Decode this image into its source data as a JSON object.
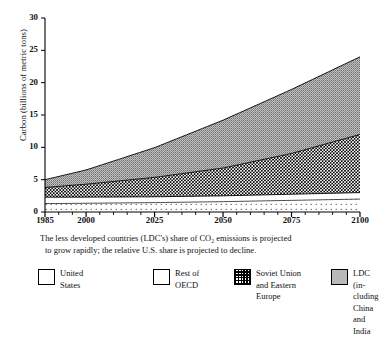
{
  "chart_data": {
    "type": "area",
    "stacked": true,
    "title": "",
    "xlabel": "",
    "ylabel": "Carbon (billions of metric tons)",
    "xlim": [
      1985,
      2100
    ],
    "ylim": [
      0,
      30
    ],
    "yticks": [
      0,
      5,
      10,
      15,
      20,
      25,
      30
    ],
    "xticks": [
      1985,
      2000,
      2025,
      2050,
      2075,
      2100
    ],
    "grid": false,
    "legend_position": "below",
    "x": [
      1985,
      2000,
      2025,
      2050,
      2075,
      2100
    ],
    "series": [
      {
        "name": "United States",
        "pattern": "sparse-dots",
        "values": [
          1.3,
          1.35,
          1.45,
          1.6,
          1.8,
          2.0
        ]
      },
      {
        "name": "Rest of OECD",
        "pattern": "white",
        "values": [
          1.0,
          0.95,
          0.9,
          0.9,
          0.95,
          1.0
        ]
      },
      {
        "name": "Soviet Union and Eastern Europe",
        "pattern": "checkerboard",
        "values": [
          1.5,
          2.0,
          3.0,
          4.3,
          6.3,
          9.0
        ]
      },
      {
        "name": "LDC (including China and India)",
        "pattern": "gray-stipple",
        "values": [
          1.2,
          2.2,
          4.6,
          7.4,
          9.9,
          12.0
        ]
      }
    ],
    "cumulative_tops": {
      "united_states": [
        1.3,
        1.35,
        1.45,
        1.6,
        1.8,
        2.0
      ],
      "rest_of_oecd": [
        2.3,
        2.3,
        2.35,
        2.5,
        2.75,
        3.0
      ],
      "soviet_and_eastern": [
        3.8,
        4.3,
        5.35,
        6.8,
        9.05,
        12.0
      ],
      "ldc_total": [
        5.0,
        6.5,
        9.95,
        14.2,
        18.95,
        24.0
      ]
    },
    "ytick_labels": [
      "0",
      "5",
      "10",
      "15",
      "20",
      "25",
      "30"
    ],
    "xtick_labels": [
      "1985",
      "2000",
      "2025",
      "2050",
      "2075",
      "2100"
    ]
  },
  "caption": {
    "line1": "The less developed countries (LDC's) share of CO₂ emissions is projected",
    "line2": "to grow rapidly; the relative U.S. share is projected to decline."
  },
  "legend": {
    "items": [
      {
        "label": "United\nStates",
        "swatch": "sw-us"
      },
      {
        "label": "Rest of\nOECD",
        "swatch": "sw-oecd"
      },
      {
        "label": "Soviet Union\nand Eastern\nEurope",
        "swatch": "sw-soviet"
      },
      {
        "label": "LDC (in-\ncluding\nChina and\nIndia",
        "swatch": "sw-ldc"
      }
    ]
  },
  "colors": {
    "axis": "#000000",
    "ldc_fill": "#b9b9b9",
    "background": "#ffffff"
  }
}
